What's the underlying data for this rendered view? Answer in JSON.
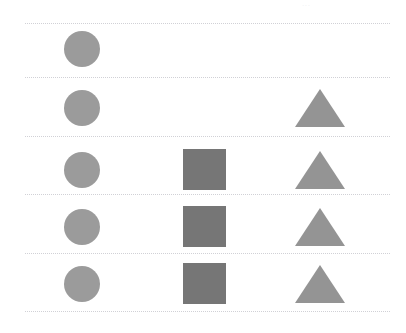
{
  "figure": {
    "title": "",
    "background_color": "#ffffff",
    "width": 406,
    "height": 333,
    "faint_top_mark": "···"
  },
  "separators": {
    "color": "#c9c9cf",
    "style": "dotted",
    "x_start": 25,
    "x_end": 390,
    "y_positions": [
      23,
      77,
      136,
      194,
      253,
      311
    ]
  },
  "palette": {
    "circle_color": "#9b9b9b",
    "square_color": "#767676",
    "triangle_color": "#949494"
  },
  "columns": [
    {
      "name": "circle-column",
      "shape": "circle",
      "center_x": 82
    },
    {
      "name": "square-column",
      "shape": "square",
      "center_x": 204
    },
    {
      "name": "triangle-column",
      "shape": "triangle",
      "center_x": 320
    }
  ],
  "rows": [
    {
      "row_index": 1,
      "band_top": 23,
      "band_bottom": 77,
      "center_y": 49,
      "cells": [
        {
          "shape": "circle",
          "present": true,
          "size": 36,
          "color": "#9b9b9b"
        },
        {
          "shape": "square",
          "present": false,
          "size": 0,
          "color": "#767676"
        },
        {
          "shape": "triangle",
          "present": false,
          "size": 0,
          "color": "#949494"
        }
      ]
    },
    {
      "row_index": 2,
      "band_top": 77,
      "band_bottom": 136,
      "center_y": 108,
      "cells": [
        {
          "shape": "circle",
          "present": true,
          "size": 36,
          "color": "#9b9b9b"
        },
        {
          "shape": "square",
          "present": false,
          "size": 0,
          "color": "#767676"
        },
        {
          "shape": "triangle",
          "present": true,
          "size": 40,
          "color": "#949494"
        }
      ]
    },
    {
      "row_index": 3,
      "band_top": 136,
      "band_bottom": 194,
      "center_y": 170,
      "cells": [
        {
          "shape": "circle",
          "present": true,
          "size": 36,
          "color": "#9b9b9b"
        },
        {
          "shape": "square",
          "present": true,
          "size": 43,
          "color": "#767676"
        },
        {
          "shape": "triangle",
          "present": true,
          "size": 40,
          "color": "#949494"
        }
      ]
    },
    {
      "row_index": 4,
      "band_top": 194,
      "band_bottom": 253,
      "center_y": 227,
      "cells": [
        {
          "shape": "circle",
          "present": true,
          "size": 36,
          "color": "#9b9b9b"
        },
        {
          "shape": "square",
          "present": true,
          "size": 43,
          "color": "#767676"
        },
        {
          "shape": "triangle",
          "present": true,
          "size": 40,
          "color": "#949494"
        }
      ]
    },
    {
      "row_index": 5,
      "band_top": 253,
      "band_bottom": 311,
      "center_y": 284,
      "cells": [
        {
          "shape": "circle",
          "present": true,
          "size": 36,
          "color": "#9b9b9b"
        },
        {
          "shape": "square",
          "present": true,
          "size": 43,
          "color": "#767676"
        },
        {
          "shape": "triangle",
          "present": true,
          "size": 40,
          "color": "#949494"
        }
      ]
    }
  ]
}
